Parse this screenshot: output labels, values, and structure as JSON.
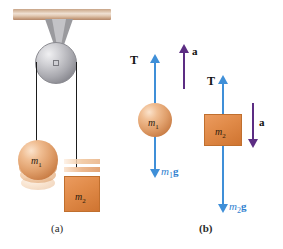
{
  "figure": {
    "background": "#ffffff",
    "colors": {
      "tension_arrow": "#3f8fd8",
      "weight_arrow": "#3f8fd8",
      "acceleration_arrow": "#5c2d83",
      "mass_orange": "#e08a48",
      "pulley_gray": "#a9a9af",
      "beam_wood": "#d9bda4",
      "label_black": "#111111",
      "weight_label_blue": "#2f7fd0"
    }
  },
  "panel_a": {
    "caption": "(a)",
    "mass1_label": "m",
    "mass1_sub": "1",
    "mass2_label": "m",
    "mass2_sub": "2",
    "parts": {
      "beam": "ceiling-beam",
      "bracket": "pulley-bracket",
      "pulley": "pulley-wheel",
      "axle": "pulley-axle",
      "cord_left": "cord-to-mass-1",
      "cord_right": "cord-to-mass-2"
    }
  },
  "panel_b": {
    "caption": "(b)",
    "body1": {
      "mass_label": "m",
      "mass_sub": "1",
      "tension_label": "T",
      "weight_label_m": "m",
      "weight_sub": "1",
      "weight_label_g": "g",
      "accel_label": "a",
      "tension_direction": "up",
      "weight_direction": "down",
      "accel_direction": "up"
    },
    "body2": {
      "mass_label": "m",
      "mass_sub": "2",
      "tension_label": "T",
      "weight_label_m": "m",
      "weight_sub": "2",
      "weight_label_g": "g",
      "accel_label": "a",
      "tension_direction": "up",
      "weight_direction": "down",
      "accel_direction": "down"
    }
  }
}
